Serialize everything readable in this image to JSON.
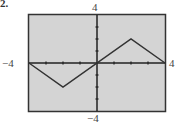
{
  "problem": {
    "label": "2."
  },
  "window_labels": {
    "ymax": "4",
    "ymin": "−4",
    "xmin": "−4",
    "xmax": "4"
  },
  "colors": {
    "plot_background": "#d4d4d4",
    "frame": "#333333",
    "axes": "#222222",
    "curve": "#333333"
  },
  "chart_data": {
    "type": "line",
    "title": "",
    "xlabel": "",
    "ylabel": "",
    "xlim": [
      -4,
      4
    ],
    "ylim": [
      -4,
      4
    ],
    "x_tick_interval": 1,
    "y_tick_interval": 1,
    "grid": false,
    "legend": null,
    "series": [
      {
        "name": "f(x)",
        "x": [
          -4,
          -2,
          2,
          4
        ],
        "y": [
          0,
          -2,
          2,
          0
        ]
      }
    ],
    "window_labels": {
      "top": "4",
      "bottom": "-4",
      "left": "-4",
      "right": "4"
    }
  }
}
